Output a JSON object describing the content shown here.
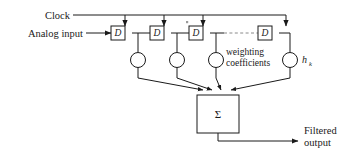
{
  "diagram": {
    "labels": {
      "clock": "Clock",
      "analog_input": "Analog input",
      "weighting_line1": "weighting",
      "weighting_line2": "coefficients",
      "coefficient_symbol": "h",
      "coefficient_subscript": "k",
      "summer_symbol": "Σ",
      "output_line1": "Filtered",
      "output_line2": "output"
    },
    "delay_blocks": [
      {
        "label": "D",
        "x": 118,
        "y": 33
      },
      {
        "label": "D",
        "x": 157,
        "y": 33
      },
      {
        "label": "D",
        "x": 196,
        "y": 33
      },
      {
        "label": "D",
        "x": 265,
        "y": 33
      }
    ],
    "multipliers": [
      {
        "name": "tap-0",
        "cx": 138,
        "cy": 60
      },
      {
        "name": "tap-1",
        "cx": 177,
        "cy": 60
      },
      {
        "name": "tap-2",
        "cx": 216,
        "cy": 60
      },
      {
        "name": "tap-3",
        "cx": 290,
        "cy": 60
      }
    ],
    "summer": {
      "x": 197,
      "y": 95,
      "width": 42,
      "height": 38
    },
    "colors": {
      "line": "#1a1a1a",
      "dashed_line": "#8a8a8a",
      "background": "#ffffff"
    }
  }
}
